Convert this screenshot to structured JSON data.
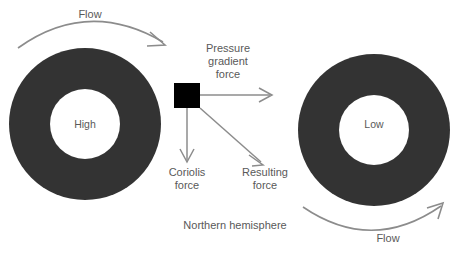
{
  "diagram": {
    "title_caption": "Northern hemisphere",
    "colors": {
      "ring": "#333333",
      "hole": "#ffffff",
      "parcel": "#000000",
      "arrow": "#808080",
      "arrow_dark": "#666666",
      "text": "#595959",
      "background": "#ffffff"
    },
    "pressure_systems": [
      {
        "id": "high",
        "center_label": "High",
        "flow_label": "Flow",
        "flow_direction": "clockwise",
        "cx": 85,
        "cy": 124,
        "outer_radius": 76,
        "inner_radius": 35
      },
      {
        "id": "low",
        "center_label": "Low",
        "flow_label": "Flow",
        "flow_direction": "counterclockwise",
        "cx": 374,
        "cy": 130,
        "outer_radius": 76,
        "inner_radius": 35
      }
    ],
    "air_parcel": {
      "name": "air-parcel",
      "x": 174,
      "y": 83,
      "width": 26,
      "height": 25
    },
    "force_vectors": [
      {
        "id": "pressure-gradient-force",
        "label": "Pressure\ngradient\nforce",
        "label_line1": "Pressure",
        "label_line2": "gradient",
        "label_line3": "force",
        "direction": "east",
        "from_x": 200,
        "from_y": 95,
        "to_x": 272,
        "to_y": 95
      },
      {
        "id": "coriolis-force",
        "label": "Coriolis\nforce",
        "label_line1": "Coriolis",
        "label_line2": "force",
        "direction": "south",
        "from_x": 187,
        "from_y": 108,
        "to_x": 187,
        "to_y": 162
      },
      {
        "id": "resulting-force",
        "label": "Resulting\nforce",
        "label_line1": "Resulting",
        "label_line2": "force",
        "direction": "southeast",
        "from_x": 200,
        "from_y": 108,
        "to_x": 263,
        "to_y": 164
      }
    ]
  }
}
